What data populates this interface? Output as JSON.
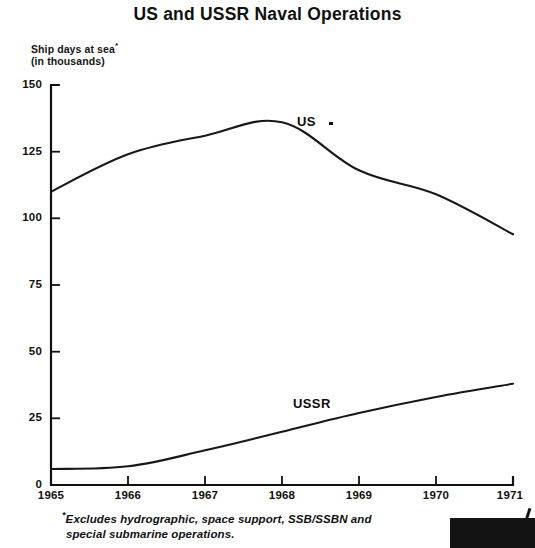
{
  "title": "US and USSR Naval Operations",
  "y_axis_caption_line1": "Ship days at sea",
  "y_axis_caption_line2": "(in thousands)",
  "y_axis_caption_marker": "*",
  "footnote_marker": "*",
  "footnote_line1": "Excludes hydrographic, space support, SSB/SSBN and",
  "footnote_line2": "special submarine operations.",
  "labels": {
    "us": "US",
    "ussr": "USSR"
  },
  "yticks": [
    "0",
    "25",
    "50",
    "75",
    "100",
    "125",
    "150"
  ],
  "xticks": [
    "1965",
    "1966",
    "1967",
    "1968",
    "1969",
    "1970",
    "1971"
  ],
  "chart_data": {
    "type": "line",
    "title": "US and USSR Naval Operations",
    "xlabel": "",
    "ylabel": "Ship days at sea (in thousands)",
    "xlim": [
      1965,
      1971
    ],
    "ylim": [
      0,
      150
    ],
    "ytick_values": [
      0,
      25,
      50,
      75,
      100,
      125,
      150
    ],
    "xtick_values": [
      1965,
      1966,
      1967,
      1968,
      1969,
      1970,
      1971
    ],
    "grid": false,
    "legend": "inline-labels",
    "x": [
      1965,
      1966,
      1967,
      1968,
      1969,
      1970,
      1971
    ],
    "series": [
      {
        "name": "US",
        "values": [
          110,
          124,
          131,
          136,
          118,
          109,
          94
        ]
      },
      {
        "name": "USSR",
        "values": [
          6,
          7,
          13,
          20,
          27,
          33,
          38
        ]
      }
    ],
    "annotations": [
      "*Excludes hydrographic, space support, SSB/SSBN and special submarine operations."
    ]
  }
}
